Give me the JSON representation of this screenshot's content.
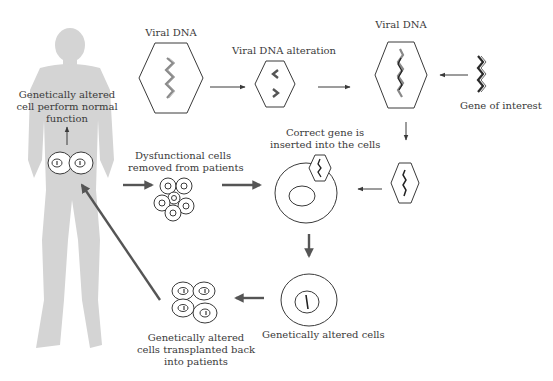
{
  "diagram": {
    "type": "process-flow",
    "labels": {
      "viral_dna_1": "Viral DNA",
      "viral_dna_alteration": "Viral DNA alteration",
      "viral_dna_2": "Viral DNA",
      "gene_of_interest": "Gene of interest",
      "correct_gene_line1": "Correct gene is",
      "correct_gene_line2": "inserted into the cells",
      "dysfunctional_line1": "Dysfunctional cells",
      "dysfunctional_line2": "removed from patients",
      "altered_perform_line1": "Genetically altered",
      "altered_perform_line2": "cell perform normal",
      "altered_perform_line3": "function",
      "altered_cells": "Genetically altered cells",
      "transplanted_line1": "Genetically altered",
      "transplanted_line2": "cells transplanted back",
      "transplanted_line3": "into patients"
    },
    "nodes": [
      {
        "id": "viral-dna",
        "label": "Viral DNA"
      },
      {
        "id": "viral-dna-alteration",
        "label": "Viral DNA alteration"
      },
      {
        "id": "viral-dna-recombinant",
        "label": "Viral DNA"
      },
      {
        "id": "gene-of-interest",
        "label": "Gene of interest"
      },
      {
        "id": "vector",
        "label": ""
      },
      {
        "id": "target-cell",
        "label": "Correct gene is inserted into the cells"
      },
      {
        "id": "dysfunctional-cells",
        "label": "Dysfunctional cells removed from patients"
      },
      {
        "id": "altered-cell",
        "label": "Genetically altered cells"
      },
      {
        "id": "transplanted-cells",
        "label": "Genetically altered cells transplanted back into patients"
      },
      {
        "id": "patient-cells",
        "label": "Genetically altered cell perform normal function"
      }
    ],
    "edges": [
      {
        "from": "viral-dna",
        "to": "viral-dna-alteration"
      },
      {
        "from": "viral-dna-alteration",
        "to": "viral-dna-recombinant"
      },
      {
        "from": "gene-of-interest",
        "to": "viral-dna-recombinant"
      },
      {
        "from": "viral-dna-recombinant",
        "to": "vector"
      },
      {
        "from": "vector",
        "to": "target-cell"
      },
      {
        "from": "patient",
        "to": "dysfunctional-cells"
      },
      {
        "from": "dysfunctional-cells",
        "to": "target-cell"
      },
      {
        "from": "target-cell",
        "to": "altered-cell"
      },
      {
        "from": "altered-cell",
        "to": "transplanted-cells"
      },
      {
        "from": "transplanted-cells",
        "to": "patient-cells"
      },
      {
        "from": "patient-cells",
        "to": "altered-perform-label"
      }
    ],
    "colors": {
      "silhouette": "#d4d4d4",
      "line": "#3a3a3a",
      "thick_arrow": "#555555",
      "dna_gray": "#8a8a8a",
      "dna_dark": "#2a2a2a"
    }
  }
}
